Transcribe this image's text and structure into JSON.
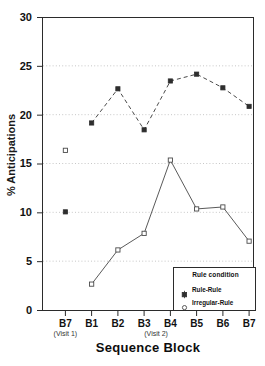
{
  "chart_data": {
    "type": "line",
    "title": "",
    "xlabel": "Sequence Block",
    "ylabel": "% Anticipations",
    "ylim": [
      0,
      30
    ],
    "yticks": [
      0,
      5,
      10,
      15,
      20,
      25,
      30
    ],
    "categories": [
      "B7",
      "B1",
      "B2",
      "B3",
      "B4",
      "B5",
      "B6",
      "B7"
    ],
    "grid": "horizontal-dotted",
    "legend_position": "bottom-right",
    "legend_title": "Rule condition",
    "series": [
      {
        "name": "Rule-Rule",
        "marker": "filled-square",
        "linestyle": "dashed",
        "color": "#3d3d3d",
        "x": [
          "B7",
          "B1",
          "B2",
          "B3",
          "B4",
          "B5",
          "B6",
          "B7"
        ],
        "values": [
          10.1,
          19.2,
          22.7,
          18.5,
          23.5,
          24.2,
          22.8,
          20.9
        ],
        "visit1_isolated": 10.1
      },
      {
        "name": "Irregular-Rule",
        "marker": "open-square",
        "linestyle": "solid",
        "color": "#555555",
        "x": [
          "B7",
          "B1",
          "B2",
          "B3",
          "B4",
          "B5",
          "B6",
          "B7"
        ],
        "values": [
          16.4,
          2.7,
          6.2,
          7.9,
          15.4,
          10.4,
          10.6,
          7.1
        ],
        "visit1_isolated": 16.4
      }
    ],
    "annotations": [
      {
        "text": "(Visit 1)",
        "under": "B7",
        "index": 0
      },
      {
        "text": "(Visit 2)",
        "under": "B3-B4",
        "index": 3
      }
    ]
  },
  "axis": {
    "ytick_labels": [
      "30",
      "25",
      "20",
      "15",
      "10",
      "5",
      "0"
    ],
    "xtick_labels": [
      "B7",
      "B1",
      "B2",
      "B3",
      "B4",
      "B5",
      "B6",
      "B7"
    ],
    "visit1_label": "(Visit 1)",
    "visit2_label": "(Visit 2)",
    "y_title": "% Anticipations",
    "x_title": "Sequence Block"
  },
  "legend": {
    "title": "Rule condition",
    "entries": [
      {
        "label": "Rule-Rule",
        "marker": "filled-square-icon"
      },
      {
        "label": "Irregular-Rule",
        "marker": "open-circle-icon"
      }
    ]
  }
}
